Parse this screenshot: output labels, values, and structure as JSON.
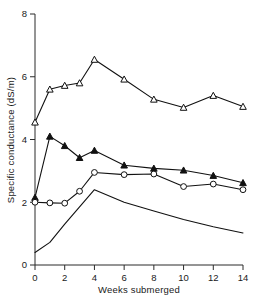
{
  "chart_data": {
    "type": "line",
    "title": "",
    "xlabel": "Weeks submerged",
    "ylabel": "Specific conductance (dS/m)",
    "xlim": [
      0,
      14
    ],
    "ylim": [
      0,
      8
    ],
    "xticks": [
      0,
      2,
      4,
      6,
      8,
      10,
      12,
      14
    ],
    "xtick_labels": [
      "0",
      "2",
      "4",
      "6",
      "8",
      "10",
      "12",
      "14"
    ],
    "yticks": [
      0,
      2,
      4,
      6,
      8
    ],
    "ytick_labels": [
      "0",
      "2",
      "4",
      "6",
      "8"
    ],
    "grid": false,
    "legend": "none",
    "series": [
      {
        "name": "series-open-triangle",
        "marker": "open-triangle",
        "x": [
          0,
          1,
          2,
          3,
          4,
          6,
          8,
          10,
          12,
          14
        ],
        "values": [
          4.55,
          5.6,
          5.72,
          5.8,
          6.55,
          5.92,
          5.28,
          5.02,
          5.4,
          5.05
        ]
      },
      {
        "name": "series-filled-triangle",
        "marker": "filled-triangle",
        "x": [
          0,
          1,
          2,
          3,
          4,
          6,
          8,
          10,
          12,
          14
        ],
        "values": [
          2.15,
          4.1,
          3.8,
          3.42,
          3.65,
          3.18,
          3.08,
          3.02,
          2.85,
          2.62
        ]
      },
      {
        "name": "series-open-circle",
        "marker": "open-circle",
        "x": [
          0,
          1,
          2,
          3,
          4,
          6,
          8,
          10,
          12,
          14
        ],
        "values": [
          2.0,
          1.98,
          1.97,
          2.35,
          2.95,
          2.88,
          2.9,
          2.5,
          2.58,
          2.4
        ]
      },
      {
        "name": "series-plain-line",
        "marker": "none",
        "x": [
          0,
          1,
          2,
          3,
          4,
          6,
          8,
          10,
          12,
          14
        ],
        "values": [
          0.4,
          0.72,
          1.3,
          1.85,
          2.4,
          2.0,
          1.72,
          1.45,
          1.22,
          1.02
        ]
      }
    ]
  },
  "axes": {
    "y_title": "Specific conductance (dS/m)",
    "x_title": "Weeks submerged"
  },
  "colors": {
    "axis": "#2b2b2b",
    "line": "#111111",
    "marker_fill_open": "#ffffff",
    "marker_fill_closed": "#111111",
    "background": "#ffffff"
  }
}
